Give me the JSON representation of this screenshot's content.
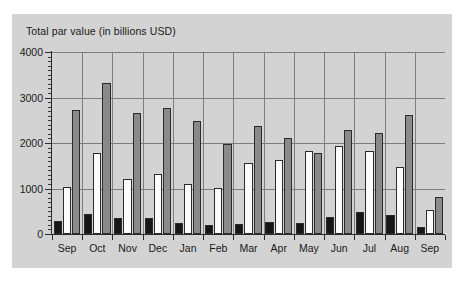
{
  "chart_data": {
    "type": "bar",
    "title": "Total par value (in billions USD)",
    "xlabel": "",
    "ylabel": "Total par value (in billions USD)",
    "ylim": [
      0,
      4000
    ],
    "yticks": [
      0,
      1000,
      2000,
      3000,
      4000
    ],
    "ytick_labels": [
      "0",
      "1000",
      "2000",
      "3000",
      "4000"
    ],
    "grid": true,
    "legend": "none",
    "categories": [
      "Sep",
      "Oct",
      "Nov",
      "Dec",
      "Jan",
      "Feb",
      "Mar",
      "Apr",
      "May",
      "Jun",
      "Jul",
      "Aug",
      "Sep"
    ],
    "series": [
      {
        "name": "series-1",
        "color": "#161616",
        "values": [
          290,
          450,
          360,
          360,
          250,
          200,
          230,
          270,
          240,
          380,
          480,
          410,
          150
        ]
      },
      {
        "name": "series-2",
        "color": "#fbfbfb",
        "values": [
          1040,
          1780,
          1200,
          1330,
          1090,
          1010,
          1570,
          1620,
          1820,
          1940,
          1820,
          1480,
          520
        ]
      },
      {
        "name": "series-3",
        "color": "#8a8a8a",
        "values": [
          2720,
          3320,
          2670,
          2760,
          2490,
          1980,
          2380,
          2120,
          1790,
          2290,
          2210,
          2620,
          820
        ]
      }
    ]
  },
  "figure": {
    "panel_color": "#d3d3d3",
    "background_color": "#ffffff",
    "axis_color": "#2b2b2b",
    "grid_color": "#7d7d7d"
  }
}
